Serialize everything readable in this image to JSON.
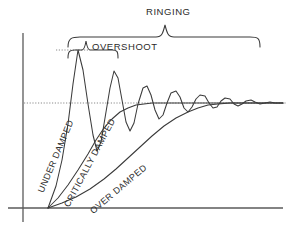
{
  "figure": {
    "background_color": "#ffffff",
    "ink_color": "#3a3a3a"
  },
  "annotations": {
    "ringing": "RINGING",
    "overshoot": "OVERSHOOT"
  },
  "curve_labels": {
    "under_damped": "UNDER DAMPED",
    "critically_damped": "CRITICALLY DAMPED",
    "over_damped": "OVER DAMPED"
  },
  "chart_data": {
    "type": "line",
    "xlabel": "",
    "ylabel": "",
    "grid": false,
    "legend_position": "inline-rotated-along-curves",
    "xlim": [
      0,
      297
    ],
    "ylim": [
      0,
      229
    ],
    "axes": {
      "y_axis_x": 23,
      "y_axis_top": 33,
      "y_axis_bottom": 222,
      "baseline_y": 208,
      "baseline_x_start": 8,
      "baseline_x_end": 283,
      "origin_x": 48
    },
    "steady_state_line": {
      "label": "",
      "y": 103,
      "x_start": 24,
      "x_end": 287,
      "style": "dotted"
    },
    "overshoot_marker": {
      "peak_x": 78,
      "peak_y": 50,
      "leader_y": 50,
      "leader_x_start": 56,
      "leader_x_end": 90,
      "style": "dotted"
    },
    "braces": [
      {
        "name": "ringing",
        "label": "RINGING",
        "x_start": 68,
        "x_end": 260,
        "tip_x": 165,
        "y": 37,
        "tip_y": 25
      },
      {
        "name": "overshoot",
        "label": "OVERSHOOT",
        "x_start": 68,
        "x_end": 118,
        "tip_x": 86,
        "y": 50,
        "tip_y": 41
      }
    ],
    "series": [
      {
        "name": "UNDER DAMPED",
        "damping": "underdamped",
        "description": "Oscillatory response with large first overshoot decaying to steady state",
        "first_peak": {
          "x": 78,
          "y": 50
        },
        "settles_x": 250,
        "points": [
          [
            48,
            208
          ],
          [
            56,
            186
          ],
          [
            62,
            160
          ],
          [
            68,
            124
          ],
          [
            73,
            84
          ],
          [
            78,
            50
          ],
          [
            83,
            70
          ],
          [
            88,
            104
          ],
          [
            93,
            135
          ],
          [
            97,
            151
          ],
          [
            101,
            142
          ],
          [
            105,
            118
          ],
          [
            110,
            88
          ],
          [
            114,
            71
          ],
          [
            118,
            78
          ],
          [
            122,
            100
          ],
          [
            126,
            122
          ],
          [
            130,
            131
          ],
          [
            134,
            123
          ],
          [
            138,
            104
          ],
          [
            143,
            88
          ],
          [
            147,
            86
          ],
          [
            151,
            95
          ],
          [
            155,
            110
          ],
          [
            159,
            119
          ],
          [
            163,
            115
          ],
          [
            167,
            103
          ],
          [
            171,
            93
          ],
          [
            176,
            91
          ],
          [
            180,
            97
          ],
          [
            184,
            108
          ],
          [
            188,
            112
          ],
          [
            192,
            107
          ],
          [
            196,
            99
          ],
          [
            200,
            95
          ],
          [
            205,
            96
          ],
          [
            209,
            103
          ],
          [
            213,
            108
          ],
          [
            217,
            107
          ],
          [
            221,
            101
          ],
          [
            225,
            98
          ],
          [
            230,
            99
          ],
          [
            234,
            104
          ],
          [
            238,
            106
          ],
          [
            242,
            104
          ],
          [
            246,
            101
          ],
          [
            251,
            100
          ],
          [
            255,
            102
          ],
          [
            260,
            104
          ],
          [
            265,
            103
          ],
          [
            270,
            102
          ],
          [
            275,
            103
          ],
          [
            283,
            103
          ]
        ]
      },
      {
        "name": "CRITICALLY DAMPED",
        "damping": "critically-damped",
        "description": "Fastest monotonic rise to steady state without overshoot",
        "settles_x": 150,
        "points": [
          [
            48,
            208
          ],
          [
            58,
            198
          ],
          [
            68,
            185
          ],
          [
            78,
            170
          ],
          [
            88,
            154
          ],
          [
            96,
            140
          ],
          [
            104,
            128
          ],
          [
            112,
            119
          ],
          [
            120,
            112
          ],
          [
            128,
            108
          ],
          [
            136,
            105
          ],
          [
            144,
            104
          ],
          [
            152,
            103
          ],
          [
            165,
            103
          ],
          [
            185,
            103
          ],
          [
            210,
            103
          ],
          [
            240,
            103
          ],
          [
            270,
            103
          ],
          [
            283,
            103
          ]
        ]
      },
      {
        "name": "OVER DAMPED",
        "damping": "overdamped",
        "description": "Slow sluggish monotonic rise, reaches steady state last",
        "settles_x": 215,
        "points": [
          [
            48,
            208
          ],
          [
            62,
            203
          ],
          [
            76,
            197
          ],
          [
            90,
            189
          ],
          [
            104,
            179
          ],
          [
            116,
            169
          ],
          [
            128,
            158
          ],
          [
            140,
            147
          ],
          [
            152,
            136
          ],
          [
            164,
            126
          ],
          [
            176,
            118
          ],
          [
            188,
            112
          ],
          [
            198,
            108
          ],
          [
            208,
            105
          ],
          [
            218,
            104
          ],
          [
            230,
            103
          ],
          [
            245,
            103
          ],
          [
            262,
            103
          ],
          [
            283,
            103
          ]
        ]
      }
    ]
  }
}
